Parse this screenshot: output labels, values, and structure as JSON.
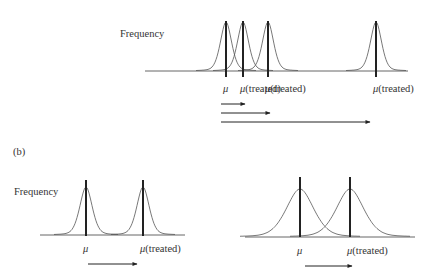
{
  "panel_a": {
    "y_label": "Frequency",
    "axis": {
      "y": 71,
      "x1": 145,
      "x2": 408
    },
    "distributions": [
      {
        "id": "control",
        "label_mu": "μ",
        "label_suffix": "",
        "x": 226,
        "width": 9
      },
      {
        "id": "treated-small",
        "label_mu": "μ",
        "label_suffix": "(treated)",
        "x": 243,
        "width": 9
      },
      {
        "id": "treated-medium",
        "label_mu": "μ",
        "label_suffix": "(treated)",
        "x": 268,
        "width": 9
      },
      {
        "id": "treated-large",
        "label_mu": "μ",
        "label_suffix": "(treated)",
        "x": 376,
        "width": 9
      }
    ],
    "bar_top": 21,
    "bar_bottom": 77,
    "peak_y": 22,
    "label_y": 92,
    "arrows": [
      {
        "y": 104,
        "x1": 221,
        "x2": 245
      },
      {
        "y": 113,
        "x1": 221,
        "x2": 270
      },
      {
        "y": 122,
        "x1": 221,
        "x2": 370
      }
    ]
  },
  "panel_b": {
    "tag": "(b)",
    "y_label": "Frequency",
    "left": {
      "axis": {
        "y": 235,
        "x1": 40,
        "x2": 185
      },
      "distributions": [
        {
          "id": "control",
          "label_mu": "μ",
          "label_suffix": "",
          "x": 86,
          "width": 10
        },
        {
          "id": "treated",
          "label_mu": "μ",
          "label_suffix": "(treated)",
          "x": 143,
          "width": 10
        }
      ],
      "bar_top": 180,
      "bar_bottom": 236,
      "peak_y": 187,
      "label_y": 252,
      "arrow": {
        "y": 264,
        "x1": 88,
        "x2": 137
      }
    },
    "right": {
      "axis": {
        "y": 237,
        "x1": 245,
        "x2": 415
      },
      "distributions": [
        {
          "id": "control",
          "label_mu": "μ",
          "label_suffix": "",
          "x": 300,
          "width": 22
        },
        {
          "id": "treated",
          "label_mu": "μ",
          "label_suffix": "(treated)",
          "x": 350,
          "width": 22
        }
      ],
      "bar_top": 177,
      "bar_bottom": 237,
      "peak_y": 189,
      "label_y": 254,
      "arrow": {
        "y": 266,
        "x1": 305,
        "x2": 352
      }
    }
  },
  "colors": {
    "ink": "#222222",
    "curve": "#555555",
    "axis": "#666666",
    "text": "#333333",
    "background": "#ffffff"
  }
}
